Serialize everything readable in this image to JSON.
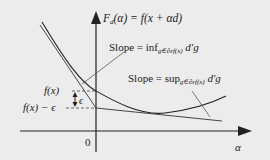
{
  "diagram": {
    "title_function": {
      "lhs": "F",
      "lhs_sub": "d",
      "rhs": "(α) = f(x + αd)"
    },
    "slope_inf_label": {
      "prefix": "Slope = inf",
      "sub": "g∈∂εf(x)",
      "suffix": " d′g"
    },
    "slope_sup_label": {
      "prefix": "Slope = sup",
      "sub": "g∈∂εf(x)",
      "suffix": " d′g"
    },
    "fx_label": "f(x)",
    "fx_minus_eps_label": "f(x) − ϵ",
    "epsilon_label": "ϵ",
    "origin_label": "0",
    "x_axis_label": "α",
    "colors": {
      "background": "#ececec",
      "ink": "#222222"
    }
  }
}
